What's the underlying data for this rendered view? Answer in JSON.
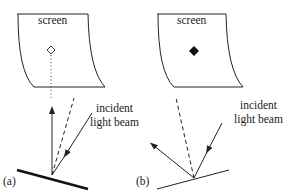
{
  "panels": [
    {
      "id": "a",
      "label": "(a)",
      "screen_label": "screen",
      "spot": "hollow-diamond",
      "beam_label": [
        "incident",
        "light beam"
      ],
      "mirror": "thick-tilted"
    },
    {
      "id": "b",
      "label": "(b)",
      "screen_label": "screen",
      "spot": "filled-diamond",
      "beam_label": [
        "incident",
        "light beam"
      ],
      "mirror": "thin-tilted"
    }
  ],
  "colors": {
    "line": "#222222",
    "background": "#ffffff"
  }
}
